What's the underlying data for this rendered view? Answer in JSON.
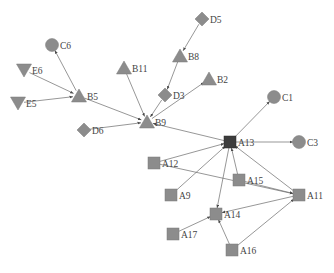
{
  "diagram": {
    "type": "directed-network",
    "colors": {
      "node_fill": "#8c8c8c",
      "hub_fill": "#3c3c3c",
      "edge": "#6a6a6a",
      "label": "#444444",
      "background": "#ffffff"
    },
    "nodes": [
      {
        "id": "C6",
        "shape": "circle",
        "x": 52,
        "y": 45
      },
      {
        "id": "E6",
        "shape": "triangle-down",
        "x": 24,
        "y": 70
      },
      {
        "id": "E5",
        "shape": "triangle-down",
        "x": 18,
        "y": 103
      },
      {
        "id": "B5",
        "shape": "triangle",
        "x": 79,
        "y": 96
      },
      {
        "id": "B11",
        "shape": "triangle",
        "x": 124,
        "y": 68
      },
      {
        "id": "D5",
        "shape": "diamond",
        "x": 202,
        "y": 19
      },
      {
        "id": "B8",
        "shape": "triangle",
        "x": 180,
        "y": 56
      },
      {
        "id": "D3",
        "shape": "diamond",
        "x": 165,
        "y": 95
      },
      {
        "id": "B2",
        "shape": "triangle",
        "x": 209,
        "y": 79
      },
      {
        "id": "D6",
        "shape": "diamond",
        "x": 84,
        "y": 130
      },
      {
        "id": "B9",
        "shape": "triangle",
        "x": 147,
        "y": 122
      },
      {
        "id": "C1",
        "shape": "circle",
        "x": 274,
        "y": 97
      },
      {
        "id": "A13",
        "shape": "square-hub",
        "x": 230,
        "y": 142
      },
      {
        "id": "C3",
        "shape": "circle",
        "x": 299,
        "y": 142
      },
      {
        "id": "A12",
        "shape": "square",
        "x": 154,
        "y": 163
      },
      {
        "id": "A9",
        "shape": "square",
        "x": 171,
        "y": 195
      },
      {
        "id": "A15",
        "shape": "square",
        "x": 239,
        "y": 180
      },
      {
        "id": "A11",
        "shape": "square",
        "x": 299,
        "y": 195
      },
      {
        "id": "A14",
        "shape": "square",
        "x": 216,
        "y": 214
      },
      {
        "id": "A17",
        "shape": "square",
        "x": 173,
        "y": 234
      },
      {
        "id": "A16",
        "shape": "square",
        "x": 232,
        "y": 250
      }
    ],
    "edges": [
      {
        "from": "B5",
        "to": "C6"
      },
      {
        "from": "E6",
        "to": "B5"
      },
      {
        "from": "E5",
        "to": "B5"
      },
      {
        "from": "B5",
        "to": "B9"
      },
      {
        "from": "B11",
        "to": "B9"
      },
      {
        "from": "D3",
        "to": "B9"
      },
      {
        "from": "D6",
        "to": "B9"
      },
      {
        "from": "B9",
        "to": "B2"
      },
      {
        "from": "D5",
        "to": "B8"
      },
      {
        "from": "B8",
        "to": "D3"
      },
      {
        "from": "A13",
        "to": "B9"
      },
      {
        "from": "A13",
        "to": "C1"
      },
      {
        "from": "A13",
        "to": "C3"
      },
      {
        "from": "A12",
        "to": "A13"
      },
      {
        "from": "A9",
        "to": "A13"
      },
      {
        "from": "A15",
        "to": "A13"
      },
      {
        "from": "A11",
        "to": "A13"
      },
      {
        "from": "A13",
        "to": "A14"
      },
      {
        "from": "A12",
        "to": "A11"
      },
      {
        "from": "A15",
        "to": "A11"
      },
      {
        "from": "A11",
        "to": "A14"
      },
      {
        "from": "A17",
        "to": "A14"
      },
      {
        "from": "A16",
        "to": "A14"
      },
      {
        "from": "A16",
        "to": "A11"
      }
    ]
  }
}
